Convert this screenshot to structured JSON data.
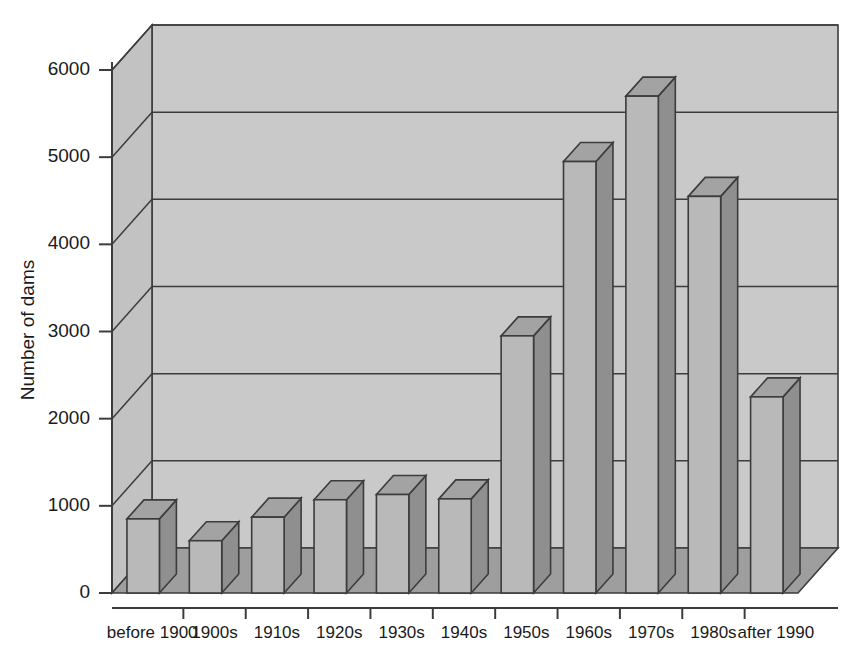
{
  "chart_data": {
    "type": "bar",
    "title": "",
    "xlabel": "",
    "ylabel": "Number of dams",
    "categories": [
      "before 1900",
      "1900s",
      "1910s",
      "1920s",
      "1930s",
      "1940s",
      "1950s",
      "1960s",
      "1970s",
      "1980s",
      "after 1990"
    ],
    "values": [
      850,
      600,
      870,
      1070,
      1130,
      1080,
      2950,
      4950,
      5700,
      4550,
      2250
    ],
    "ylim": [
      0,
      6000
    ],
    "yticks": [
      0,
      1000,
      2000,
      3000,
      4000,
      5000,
      6000
    ],
    "ytick_labels": [
      "0",
      "1000",
      "2000",
      "3000",
      "4000",
      "5000",
      "6000"
    ],
    "grid": true,
    "legend": false,
    "style": "3d-column",
    "colors": {
      "bar_front": "#b9b9b9",
      "bar_top": "#a3a3a3",
      "bar_side": "#8f8f8f",
      "wall_back": "#c9c9c9",
      "wall_left": "#c2c2c2",
      "floor": "#9e9e9e",
      "outline": "#3c3c3c",
      "text": "#1a1a1a"
    }
  },
  "axis": {
    "y_title": "Number of dams",
    "ticks": [
      {
        "value": 6000,
        "label": "6000"
      },
      {
        "value": 5000,
        "label": "5000"
      },
      {
        "value": 4000,
        "label": "4000"
      },
      {
        "value": 3000,
        "label": "3000"
      },
      {
        "value": 2000,
        "label": "2000"
      },
      {
        "value": 1000,
        "label": "1000"
      },
      {
        "value": 0,
        "label": "0"
      }
    ]
  },
  "categories": [
    {
      "label": "before 1900",
      "value": 850
    },
    {
      "label": "1900s",
      "value": 600
    },
    {
      "label": "1910s",
      "value": 870
    },
    {
      "label": "1920s",
      "value": 1070
    },
    {
      "label": "1930s",
      "value": 1130
    },
    {
      "label": "1940s",
      "value": 1080
    },
    {
      "label": "1950s",
      "value": 2950
    },
    {
      "label": "1960s",
      "value": 4950
    },
    {
      "label": "1970s",
      "value": 5700
    },
    {
      "label": "1980s",
      "value": 4550
    },
    {
      "label": "after 1990",
      "value": 2250
    }
  ]
}
